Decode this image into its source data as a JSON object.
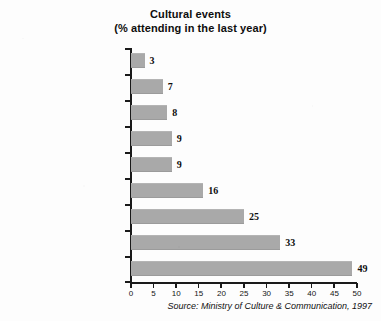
{
  "chart_data": {
    "type": "bar",
    "orientation": "horizontal",
    "title": "Cultural events",
    "subtitle": "(% attending in the last year)",
    "xlabel": "",
    "ylabel": "",
    "xlim": [
      0,
      50
    ],
    "xticks": [
      0,
      5,
      10,
      15,
      20,
      25,
      30,
      35,
      40,
      45,
      50
    ],
    "grid": false,
    "legend": false,
    "bar_color": "#a9a9a9",
    "axis_color": "#1a1a1a",
    "categories": [
      "Opera",
      "Jazz concert",
      "Dance performance",
      "Rock music concert",
      "Classical music concert",
      "Theatre",
      "Art exhibition",
      "Museum",
      "Cinema"
    ],
    "values": [
      3,
      7,
      8,
      9,
      9,
      16,
      25,
      33,
      49
    ],
    "data_labels": [
      "3",
      "7",
      "8",
      "9",
      "9",
      "16",
      "25",
      "33",
      "49"
    ],
    "source": "Source: Ministry of Culture & Communication, 1997"
  }
}
